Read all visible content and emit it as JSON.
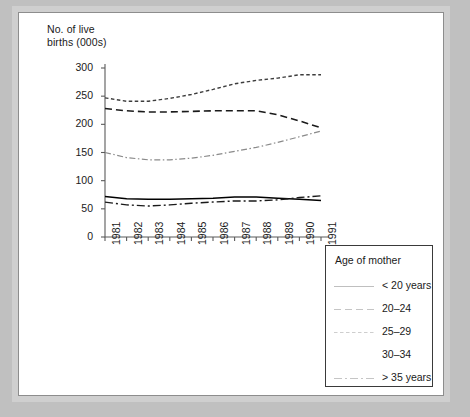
{
  "figure": {
    "y_axis_title_line1": "No. of live",
    "y_axis_title_line2": "births (000s)"
  },
  "legend": {
    "title": "Age of mother"
  },
  "chart_data": {
    "type": "line",
    "title": "",
    "ylabel": "No. of live births (000s)",
    "xlabel": "",
    "grid": false,
    "legend_position": "bottom-right",
    "legend_title": "Age of mother",
    "ylim": [
      0,
      300
    ],
    "yticks": [
      0,
      50,
      100,
      150,
      200,
      250,
      300
    ],
    "categories": [
      1981,
      1982,
      1983,
      1984,
      1985,
      1986,
      1987,
      1988,
      1989,
      1990,
      1991
    ],
    "xticklabels": [
      "1981",
      "1982",
      "1983",
      "1984",
      "1985",
      "1986",
      "1987",
      "1988",
      "1989",
      "1990",
      "1991"
    ],
    "series": [
      {
        "name": "< 20 years",
        "style": "solid",
        "color": "#000000",
        "values": [
          72,
          68,
          67,
          67,
          68,
          69,
          71,
          71,
          69,
          67,
          65
        ]
      },
      {
        "name": "20–24",
        "style": "dashed",
        "color": "#1a1a1a",
        "values": [
          228,
          224,
          222,
          222,
          223,
          224,
          224,
          224,
          217,
          206,
          194
        ]
      },
      {
        "name": "25–29",
        "style": "dotted",
        "color": "#3d3d3d",
        "values": [
          247,
          241,
          241,
          246,
          253,
          262,
          272,
          278,
          282,
          288,
          288
        ]
      },
      {
        "name": "30–34",
        "style": "dashdot-light",
        "color": "#8a8a8a",
        "values": [
          150,
          141,
          137,
          137,
          140,
          145,
          152,
          159,
          168,
          178,
          188
        ]
      },
      {
        "name": "> 35 years",
        "style": "dashdot",
        "color": "#1a1a1a",
        "values": [
          62,
          57,
          55,
          57,
          60,
          62,
          64,
          64,
          66,
          70,
          73
        ]
      }
    ]
  }
}
